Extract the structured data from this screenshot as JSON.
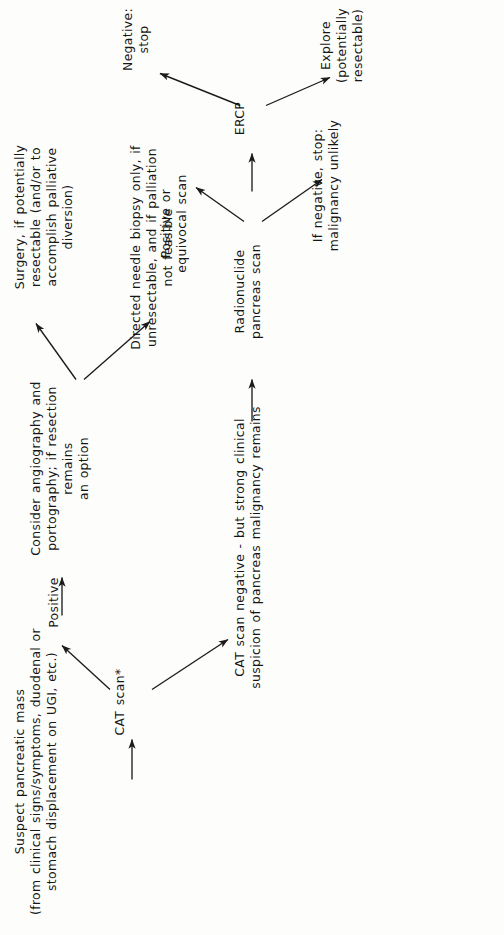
{
  "diagram": {
    "orientation": "rotated-90-ccw",
    "stroke_color": "#1b1b1b",
    "background_color": "#fdfdfc",
    "nodes": {
      "suspect_mass": "Suspect pancreatic mass\n(from clinical signs/symptoms, duodenal or\nstomach displacement on UGI, etc.)",
      "cat_scan": "CAT scan*",
      "positive": "Positive",
      "angiography": "Consider angiography and\nportography; if resection remains\nan option",
      "surgery": "Surgery, if potentially\nresectable (and/or to\naccomplish palliative\ndiversion)",
      "needle_biopsy": "Directed needle biopsy only, if\nunresectable, and if palliation\nnot feasible",
      "cat_negative": "CAT scan negative - but strong clinical\nsuspicion of pancreas malignancy remains",
      "radionuclide": "Radionuclide\npancreas scan",
      "positive_equivocal": "Positive or\nequivocal scan",
      "if_negative": "If negative, stop:\nmalignancy unlikely",
      "ercp": "ERCP",
      "negative_stop": "Negative:  stop",
      "explore": "Explore\n(potentially resectable)"
    }
  }
}
